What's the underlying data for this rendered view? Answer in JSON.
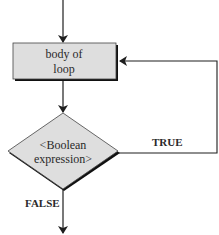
{
  "diagram": {
    "type": "flowchart",
    "nodes": {
      "body": {
        "shape": "process",
        "lines": [
          "body of",
          "loop"
        ]
      },
      "condition": {
        "shape": "decision",
        "lines": [
          "<Boolean",
          "expression>"
        ]
      }
    },
    "edges": {
      "entry": {
        "from": "start",
        "to": "body"
      },
      "body_to_condition": {
        "from": "body",
        "to": "condition"
      },
      "true_branch": {
        "from": "condition",
        "to": "body",
        "label": "TRUE"
      },
      "false_branch": {
        "from": "condition",
        "to": "exit",
        "label": "FALSE"
      }
    },
    "colors": {
      "node_fill": "#dedede",
      "stroke": "#1e1e1e",
      "shadow": "#111111",
      "text": "#2a2a2a"
    }
  }
}
